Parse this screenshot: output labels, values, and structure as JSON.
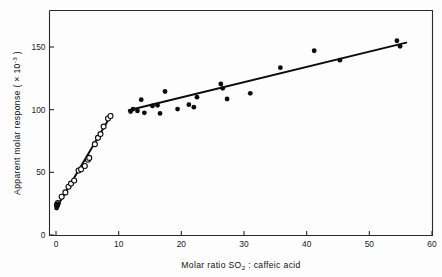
{
  "figure": {
    "background_color": "#fdfdfd",
    "ink_color": "#0b0b0b",
    "axis_color": "#2a2a2a"
  },
  "chart_data": {
    "type": "scatter",
    "title": "",
    "xlabel_parts": {
      "prefix": "Molar ratio SO",
      "subscript": "2",
      "suffix": " : caffeic acid"
    },
    "xlabel": "Molar ratio SO2 : caffeic acid",
    "ylabel_parts": {
      "prefix": "Apparent molar response ( × 10",
      "superscript": "-3",
      "suffix": " )"
    },
    "ylabel": "Apparent molar response ( x 10-3 )",
    "xlim": [
      0,
      60
    ],
    "ylim": [
      0,
      165
    ],
    "xticks": [
      0,
      10,
      20,
      30,
      40,
      50,
      60
    ],
    "xticklabels": [
      "0",
      "10",
      "20",
      "30",
      "40",
      "50",
      "60"
    ],
    "yticks": [
      0,
      50,
      100,
      150
    ],
    "yticklabels": [
      "0",
      "50",
      "100",
      "150"
    ],
    "grid": false,
    "legend": null,
    "legend_position": "none",
    "series": [
      {
        "name": "Low molar ratio region (open circles)",
        "marker": "open-circle",
        "points": [
          {
            "x": 0.15,
            "y": 24.0
          },
          {
            "x": 0.3,
            "y": 25.5
          },
          {
            "x": 0.9,
            "y": 30.5
          },
          {
            "x": 1.5,
            "y": 34.0
          },
          {
            "x": 2.0,
            "y": 38.5
          },
          {
            "x": 2.4,
            "y": 41.0
          },
          {
            "x": 2.9,
            "y": 43.5
          },
          {
            "x": 3.6,
            "y": 51.5
          },
          {
            "x": 4.0,
            "y": 52.5
          },
          {
            "x": 4.6,
            "y": 55.0
          },
          {
            "x": 5.1,
            "y": 60.0
          },
          {
            "x": 5.3,
            "y": 61.5
          },
          {
            "x": 6.2,
            "y": 72.5
          },
          {
            "x": 6.7,
            "y": 77.5
          },
          {
            "x": 7.1,
            "y": 80.5
          },
          {
            "x": 7.6,
            "y": 86.5
          },
          {
            "x": 8.3,
            "y": 93.0
          },
          {
            "x": 8.7,
            "y": 95.0
          }
        ]
      },
      {
        "name": "Full range (filled circles)",
        "marker": "filled-circle",
        "points": [
          {
            "x": 0.1,
            "y": 21.5
          },
          {
            "x": 0.2,
            "y": 23.0
          },
          {
            "x": 0.3,
            "y": 25.0
          },
          {
            "x": 11.9,
            "y": 98.5
          },
          {
            "x": 12.3,
            "y": 100.5
          },
          {
            "x": 13.0,
            "y": 99.0
          },
          {
            "x": 13.6,
            "y": 108.0
          },
          {
            "x": 14.1,
            "y": 97.5
          },
          {
            "x": 15.4,
            "y": 103.0
          },
          {
            "x": 16.2,
            "y": 103.5
          },
          {
            "x": 16.6,
            "y": 97.0
          },
          {
            "x": 17.4,
            "y": 114.5
          },
          {
            "x": 19.4,
            "y": 100.5
          },
          {
            "x": 21.2,
            "y": 104.0
          },
          {
            "x": 22.0,
            "y": 102.0
          },
          {
            "x": 22.5,
            "y": 110.0
          },
          {
            "x": 26.3,
            "y": 120.5
          },
          {
            "x": 26.6,
            "y": 117.0
          },
          {
            "x": 27.3,
            "y": 108.5
          },
          {
            "x": 31.0,
            "y": 113.0
          },
          {
            "x": 35.8,
            "y": 133.5
          },
          {
            "x": 41.2,
            "y": 147.0
          },
          {
            "x": 45.3,
            "y": 139.5
          },
          {
            "x": 54.4,
            "y": 155.0
          },
          {
            "x": 54.9,
            "y": 150.5
          }
        ]
      }
    ],
    "fit_lines": [
      {
        "name": "steep-initial-fit",
        "x0": 0.05,
        "y0": 21.5,
        "x1": 8.9,
        "y1": 96.5
      },
      {
        "name": "shallow-plateau-fit",
        "x0": 11.6,
        "y0": 99.5,
        "x1": 55.9,
        "y1": 153.5
      }
    ]
  }
}
